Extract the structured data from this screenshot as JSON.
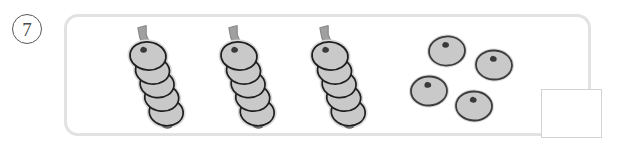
{
  "item": {
    "number_label": "7",
    "badge_shape": "circled-number"
  },
  "panel": {
    "shape": "rounded-rectangle",
    "border_color": "#e2e2e2",
    "fill_color": "#ffffff"
  },
  "answer_box": {
    "value": "",
    "placeholder": "",
    "border_color": "#d3d3d5",
    "fill_color": "#ffffff"
  },
  "colors": {
    "segment_fill": "#c9c9c9",
    "segment_outline": "#1f1f1f",
    "segment_halo": "#d9d9d9",
    "antenna_fill": "#a0a0a0",
    "antenna_outline": "#8c8c8c",
    "eye_color": "#3a3a3a",
    "loose_outline": "#3c3c3c",
    "number_color": "#4b4b4d"
  },
  "counts": {
    "complete_caterpillars": 3,
    "segments_per_caterpillar": 5,
    "body_segments_per_caterpillar": 4,
    "loose_segments": 4
  },
  "caterpillars": [
    {
      "name": "caterpillar-1",
      "head": {
        "cx": 148,
        "cy": 56
      },
      "antenna_tip": {
        "x": 136,
        "y": 30
      },
      "body_segments": [
        {
          "cx": 154,
          "cy": 70
        },
        {
          "cx": 160,
          "cy": 83
        },
        {
          "cx": 166,
          "cy": 96
        },
        {
          "cx": 172,
          "cy": 110
        }
      ]
    },
    {
      "name": "caterpillar-2",
      "head": {
        "cx": 239,
        "cy": 56
      },
      "antenna_tip": {
        "x": 227,
        "y": 30
      },
      "body_segments": [
        {
          "cx": 245,
          "cy": 70
        },
        {
          "cx": 251,
          "cy": 83
        },
        {
          "cx": 257,
          "cy": 96
        },
        {
          "cx": 263,
          "cy": 110
        }
      ]
    },
    {
      "name": "caterpillar-3",
      "head": {
        "cx": 330,
        "cy": 56
      },
      "antenna_tip": {
        "x": 318,
        "y": 30
      },
      "body_segments": [
        {
          "cx": 336,
          "cy": 70
        },
        {
          "cx": 342,
          "cy": 83
        },
        {
          "cx": 348,
          "cy": 96
        },
        {
          "cx": 354,
          "cy": 110
        }
      ]
    }
  ],
  "loose_segments": [
    {
      "name": "loose-segment-1",
      "cx": 447,
      "cy": 51
    },
    {
      "name": "loose-segment-2",
      "cx": 494,
      "cy": 65
    },
    {
      "name": "loose-segment-3",
      "cx": 429,
      "cy": 91
    },
    {
      "name": "loose-segment-4",
      "cx": 474,
      "cy": 106
    }
  ]
}
